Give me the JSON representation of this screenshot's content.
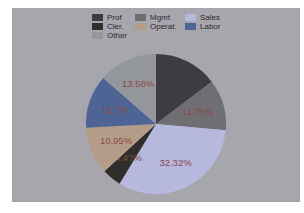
{
  "chart_data": {
    "type": "pie",
    "title": "",
    "legend_position": "top",
    "categories": [
      "Prof",
      "Mgmt",
      "Sales",
      "Cler.",
      "Operat.",
      "Labor",
      "Other"
    ],
    "values": [
      14.66,
      11.75,
      32.32,
      4.45,
      10.95,
      12.29,
      13.58
    ],
    "labels": [
      "",
      "11.75%",
      "32.32%",
      "4.4?%",
      "10.95%",
      "12.?%",
      "13.58%"
    ],
    "colors": [
      "#3e3c42",
      "#6f6e73",
      "#b6b8de",
      "#2e2f2c",
      "#b39d88",
      "#4d6494",
      "#93969a"
    ]
  },
  "legend": {
    "items": [
      {
        "label": "Prof",
        "color": "#3e3c42"
      },
      {
        "label": "Mgmt",
        "color": "#6f6e73"
      },
      {
        "label": "Sales",
        "color": "#b6b8de"
      },
      {
        "label": "Cler.",
        "color": "#2e2f2c"
      },
      {
        "label": "Operat.",
        "color": "#b39d88"
      },
      {
        "label": "Labor",
        "color": "#4d6494"
      },
      {
        "label": "Other",
        "color": "#93969a"
      }
    ]
  }
}
